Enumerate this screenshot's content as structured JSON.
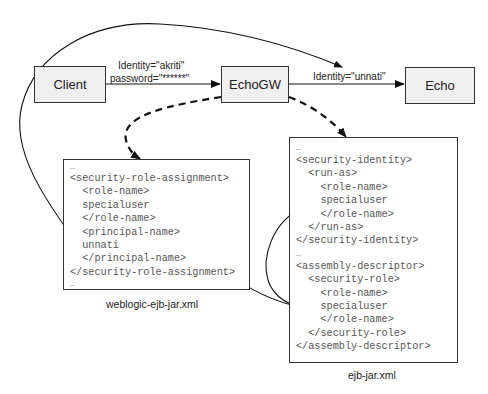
{
  "nodes": {
    "client": {
      "label": "Client"
    },
    "echogw": {
      "label": "EchoGW"
    },
    "echo": {
      "label": "Echo"
    }
  },
  "edges": {
    "client_to_echogw": {
      "identity_label": "Identity=\"akriti\"",
      "password_label": "password=\"******\""
    },
    "echogw_to_echo": {
      "identity_label": "Identity=\"unnati\""
    }
  },
  "weblogic_file": {
    "caption": "weblogic-ejb-jar.xml",
    "lines": [
      "…",
      "<security-role-assignment>",
      "  <role-name>",
      "  specialuser",
      "  </role-name>",
      "  <principal-name>",
      "  unnati",
      "  </principal-name>",
      "</security-role-assignment>",
      "…"
    ]
  },
  "ejb_file": {
    "caption": "ejb-jar.xml",
    "lines": [
      "…",
      "<security-identity>",
      "  <run-as>",
      "    <role-name>",
      "    specialuser",
      "    </role-name>",
      "  </run-as>",
      "</security-identity>",
      "…",
      "<assembly-descriptor>",
      "  <security-role>",
      "    <role-name>",
      "    specialuser",
      "    </role-name>",
      "  </security-role>",
      "</assembly-descriptor>"
    ]
  },
  "colors": {
    "node_fill": "#efefef",
    "stroke": "#111111",
    "xml_text": "#555555"
  }
}
